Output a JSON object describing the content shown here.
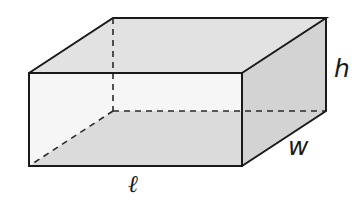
{
  "figure": {
    "colors": {
      "background": "#ffffff",
      "edge": "#1a1a1a",
      "hidden_edge": "#2a2a2a",
      "top_face": "#e2e2e2",
      "front_face": "#efefef",
      "right_face": "#d3d3d3",
      "floor_face": "#c4c4c4"
    },
    "vertices": {
      "front_top_left": [
        29,
        73
      ],
      "front_top_right": [
        242,
        73
      ],
      "front_bottom_left": [
        29,
        166
      ],
      "front_bottom_right": [
        242,
        166
      ],
      "back_top_left": [
        113,
        18
      ],
      "back_top_right": [
        326,
        18
      ],
      "back_bottom_left": [
        113,
        111
      ],
      "back_bottom_right": [
        326,
        111
      ]
    },
    "labels": {
      "height": "h",
      "width": "w",
      "length": "ℓ"
    }
  }
}
